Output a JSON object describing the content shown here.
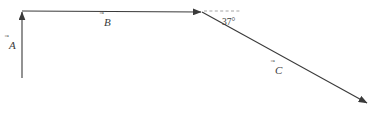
{
  "figure": {
    "background_color": "#ffffff",
    "stroke_color": "#3a3a3a",
    "dash_color": "#9a9a9a",
    "width": 380,
    "height": 116
  },
  "vectors": [
    {
      "id": "A",
      "label": "A",
      "accent": "⃗",
      "direction": "up",
      "tail": {
        "x": 22,
        "y": 78
      },
      "tip": {
        "x": 22,
        "y": 11
      },
      "label_pos": {
        "x": 9,
        "y": 49
      },
      "style": "solid"
    },
    {
      "id": "B",
      "label": "B",
      "accent": "⃗",
      "direction": "right",
      "tail": {
        "x": 22,
        "y": 11
      },
      "tip": {
        "x": 202,
        "y": 12
      },
      "label_pos": {
        "x": 104,
        "y": 26
      },
      "style": "solid"
    },
    {
      "id": "C",
      "label": "C",
      "accent": "⃗",
      "direction": "down-right",
      "tail": {
        "x": 202,
        "y": 12
      },
      "tip": {
        "x": 368,
        "y": 104
      },
      "label_pos": {
        "x": 275,
        "y": 74
      },
      "style": "solid"
    }
  ],
  "reference_line": {
    "name": "horizontal-dashed-reference",
    "from": {
      "x": 203,
      "y": 11
    },
    "to": {
      "x": 241,
      "y": 11
    },
    "style": "dashed"
  },
  "angle": {
    "value": "37",
    "unit": "°",
    "text": "37°",
    "pos": {
      "x": 222,
      "y": 25
    },
    "between": [
      "reference-line",
      "C"
    ]
  }
}
